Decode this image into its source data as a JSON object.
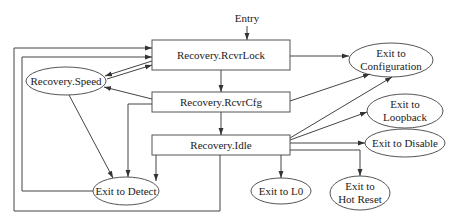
{
  "diagram": {
    "entry_label": "Entry",
    "states": [
      {
        "id": "rcvrlock",
        "label": "Recovery.RcvrLock",
        "shape": "box"
      },
      {
        "id": "rcvrcfg",
        "label": "Recovery.RcvrCfg",
        "shape": "box"
      },
      {
        "id": "idle",
        "label": "Recovery.Idle",
        "shape": "box"
      },
      {
        "id": "speed",
        "label": "Recovery.Speed",
        "shape": "ellipse"
      }
    ],
    "exits": [
      {
        "id": "config",
        "line1": "Exit to",
        "line2": "Configuration"
      },
      {
        "id": "loopback",
        "line1": "Exit to",
        "line2": "Loopback"
      },
      {
        "id": "disable",
        "label": "Exit to Disable"
      },
      {
        "id": "detect",
        "label": "Exit to Detect"
      },
      {
        "id": "l0",
        "label": "Exit to L0"
      },
      {
        "id": "hotreset",
        "line1": "Exit to",
        "line2": "Hot Reset"
      }
    ],
    "edges": [
      [
        "entry",
        "rcvrlock"
      ],
      [
        "rcvrlock",
        "rcvrcfg"
      ],
      [
        "rcvrcfg",
        "idle"
      ],
      [
        "rcvrlock",
        "speed"
      ],
      [
        "speed",
        "rcvrlock"
      ],
      [
        "rcvrcfg",
        "speed"
      ],
      [
        "speed",
        "detect"
      ],
      [
        "rcvrlock",
        "config"
      ],
      [
        "rcvrcfg",
        "config"
      ],
      [
        "idle",
        "config"
      ],
      [
        "idle",
        "loopback"
      ],
      [
        "idle",
        "disable"
      ],
      [
        "idle",
        "l0"
      ],
      [
        "idle",
        "hotreset"
      ],
      [
        "rcvrcfg",
        "detect"
      ],
      [
        "idle",
        "detect"
      ],
      [
        "detect-loop",
        "rcvrlock"
      ],
      [
        "idle-loop",
        "rcvrlock"
      ]
    ]
  }
}
